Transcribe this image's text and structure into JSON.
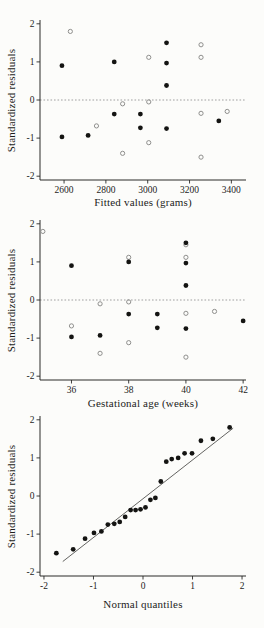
{
  "figure": {
    "colors": {
      "background": "#fcfcfa",
      "text": "#1d1d1b",
      "axis": "#2a2a28",
      "filled_marker": "#141412",
      "open_marker": "#8f8f8d",
      "zero_line": "#7a7a78",
      "ref_line": "#3c3c3a"
    }
  },
  "chart_data": [
    {
      "type": "scatter",
      "title": "",
      "xlabel": "Fitted values (grams)",
      "ylabel": "Standardized residuals",
      "xlim": [
        2485,
        3470
      ],
      "ylim": [
        -2.1,
        2.1
      ],
      "xticks": [
        2600,
        2800,
        3000,
        3200,
        3400
      ],
      "yticks": [
        -2,
        -1,
        0,
        1,
        2
      ],
      "grid": false,
      "legend": false,
      "zero_line": true,
      "series": [
        {
          "name": "open-circles",
          "marker": "open-circle",
          "points": [
            [
              2630,
              1.8
            ],
            [
              2755,
              -0.68
            ],
            [
              2880,
              -0.1
            ],
            [
              2880,
              -1.4
            ],
            [
              3005,
              1.12
            ],
            [
              3005,
              -0.05
            ],
            [
              3005,
              -1.12
            ],
            [
              3255,
              1.45
            ],
            [
              3255,
              1.12
            ],
            [
              3255,
              -0.35
            ],
            [
              3255,
              -1.5
            ],
            [
              3380,
              -0.3
            ]
          ]
        },
        {
          "name": "filled-circles",
          "marker": "filled-circle",
          "points": [
            [
              2590,
              0.9
            ],
            [
              2590,
              -0.97
            ],
            [
              2715,
              -0.93
            ],
            [
              2840,
              1.0
            ],
            [
              2840,
              -0.37
            ],
            [
              2965,
              -0.37
            ],
            [
              2965,
              -0.73
            ],
            [
              3090,
              1.5
            ],
            [
              3090,
              0.97
            ],
            [
              3090,
              0.38
            ],
            [
              3090,
              -0.75
            ],
            [
              3340,
              -0.55
            ]
          ]
        }
      ]
    },
    {
      "type": "scatter",
      "title": "",
      "xlabel": "Gestational age (weeks)",
      "ylabel": "Standardized residuals",
      "xlim": [
        34.9,
        42.1
      ],
      "ylim": [
        -2.1,
        2.1
      ],
      "xticks": [
        36,
        38,
        40,
        42
      ],
      "yticks": [
        -2,
        -1,
        0,
        1,
        2
      ],
      "grid": false,
      "legend": false,
      "zero_line": true,
      "series": [
        {
          "name": "open-circles",
          "marker": "open-circle",
          "points": [
            [
              35,
              1.8
            ],
            [
              36,
              -0.68
            ],
            [
              37,
              -0.1
            ],
            [
              37,
              -1.4
            ],
            [
              38,
              1.12
            ],
            [
              38,
              -0.05
            ],
            [
              38,
              -1.12
            ],
            [
              40,
              1.45
            ],
            [
              40,
              1.12
            ],
            [
              40,
              -0.35
            ],
            [
              40,
              -1.5
            ],
            [
              41,
              -0.3
            ]
          ]
        },
        {
          "name": "filled-circles",
          "marker": "filled-circle",
          "points": [
            [
              36,
              0.9
            ],
            [
              36,
              -0.97
            ],
            [
              37,
              -0.93
            ],
            [
              38,
              1.0
            ],
            [
              38,
              -0.37
            ],
            [
              39,
              -0.37
            ],
            [
              39,
              -0.73
            ],
            [
              40,
              1.5
            ],
            [
              40,
              0.97
            ],
            [
              40,
              0.38
            ],
            [
              40,
              -0.75
            ],
            [
              42,
              -0.55
            ]
          ]
        }
      ]
    },
    {
      "type": "scatter",
      "title": "",
      "xlabel": "Normal quantiles",
      "ylabel": "Standardized residuals",
      "xlim": [
        -2.08,
        2.08
      ],
      "ylim": [
        -2.1,
        2.1
      ],
      "xticks": [
        -2,
        -1,
        0,
        1,
        2
      ],
      "yticks": [
        -2,
        -1,
        0,
        1,
        2
      ],
      "grid": false,
      "legend": false,
      "zero_line": false,
      "ref_line": {
        "x1": -1.62,
        "y1": -1.72,
        "x2": 1.82,
        "y2": 1.78
      },
      "series": [
        {
          "name": "filled-circles",
          "marker": "filled-circle",
          "points": [
            [
              -1.75,
              -1.5
            ],
            [
              -1.41,
              -1.4
            ],
            [
              -1.17,
              -1.12
            ],
            [
              -0.99,
              -0.97
            ],
            [
              -0.84,
              -0.93
            ],
            [
              -0.71,
              -0.75
            ],
            [
              -0.58,
              -0.73
            ],
            [
              -0.47,
              -0.68
            ],
            [
              -0.36,
              -0.55
            ],
            [
              -0.25,
              -0.37
            ],
            [
              -0.15,
              -0.37
            ],
            [
              -0.05,
              -0.35
            ],
            [
              0.05,
              -0.3
            ],
            [
              0.15,
              -0.1
            ],
            [
              0.25,
              -0.05
            ],
            [
              0.36,
              0.38
            ],
            [
              0.47,
              0.9
            ],
            [
              0.58,
              0.97
            ],
            [
              0.71,
              1.0
            ],
            [
              0.84,
              1.12
            ],
            [
              0.99,
              1.12
            ],
            [
              1.17,
              1.45
            ],
            [
              1.41,
              1.5
            ],
            [
              1.75,
              1.8
            ]
          ]
        }
      ]
    }
  ]
}
